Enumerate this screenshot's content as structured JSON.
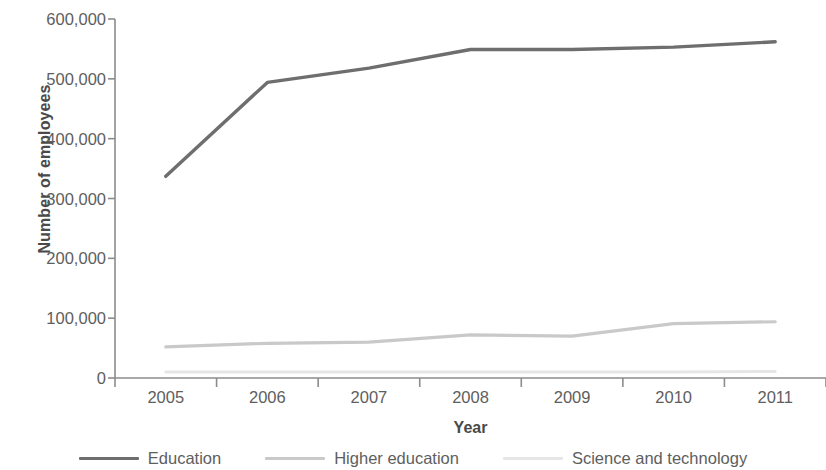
{
  "chart_data": {
    "type": "line",
    "title": "",
    "xlabel": "Year",
    "ylabel": "Number of employees",
    "categories": [
      "2005",
      "2006",
      "2007",
      "2008",
      "2009",
      "2010",
      "2011"
    ],
    "x": [
      2005,
      2006,
      2007,
      2008,
      2009,
      2010,
      2011
    ],
    "xlim": [
      2004.5,
      2011.5
    ],
    "ylim": [
      0,
      600000
    ],
    "yticks": [
      0,
      100000,
      200000,
      300000,
      400000,
      500000,
      600000
    ],
    "ytick_labels": [
      "0",
      "100,000",
      "200,000",
      "300,000",
      "400,000",
      "500,000",
      "600,000"
    ],
    "xtick_labels": [
      "2005",
      "2006",
      "2007",
      "2008",
      "2009",
      "2010",
      "2011"
    ],
    "grid": false,
    "legend_position": "bottom",
    "series": [
      {
        "name": "Education",
        "color": "#6e6e6e",
        "width": 3.4,
        "values": [
          337000,
          494000,
          518000,
          549000,
          549000,
          553000,
          562000
        ]
      },
      {
        "name": "Higher education",
        "color": "#c9c9c9",
        "width": 3.2,
        "values": [
          52000,
          58000,
          60000,
          72000,
          70000,
          91000,
          94000
        ]
      },
      {
        "name": "Science and technology",
        "color": "#e6e6e6",
        "width": 3.0,
        "values": [
          10000,
          10000,
          10000,
          10000,
          10000,
          10000,
          11000
        ]
      }
    ]
  },
  "axis": {
    "line_color": "#8c8c8c",
    "tick_color": "#8c8c8c"
  }
}
